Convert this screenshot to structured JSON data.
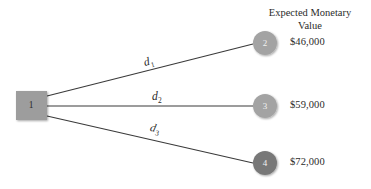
{
  "figure": {
    "type": "decision-tree",
    "background_color": "#ffffff",
    "line_color": "#3a3a3a",
    "decision_node_fill": "#9d9d9d",
    "outcome_node_fill": "#a3a3a3",
    "outcome_node_fill_dark": "#787878",
    "text_color": "#2b2b2b"
  },
  "header": {
    "line1": "Expected Monetary",
    "line2": "Value"
  },
  "decision_node": {
    "label": "1",
    "shape": "square"
  },
  "branches": [
    {
      "label": "d",
      "subscript": "1"
    },
    {
      "label": "d",
      "subscript": "2"
    },
    {
      "label": "d",
      "subscript": "3"
    }
  ],
  "outcomes": [
    {
      "node": "2",
      "value": "$46,000"
    },
    {
      "node": "3",
      "value": "$59,000"
    },
    {
      "node": "4",
      "value": "$72,000"
    }
  ]
}
